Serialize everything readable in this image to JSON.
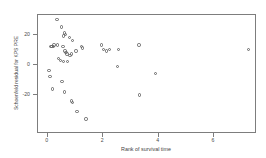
{
  "chart_data": {
    "type": "scatter",
    "title": "",
    "xlabel": "Rank of survival time",
    "ylabel": "Schoenfeld residual for KPS PRE",
    "xlim": [
      -0.35,
      7.55
    ],
    "ylim": [
      -46,
      33
    ],
    "xticks": [
      0,
      2,
      4,
      6
    ],
    "xticklabels": [
      "0",
      "2",
      "4",
      "6"
    ],
    "yticks": [
      20,
      0,
      -20
    ],
    "yticklabels": [
      "20",
      "0",
      "-20"
    ],
    "grid": false,
    "legend": null,
    "marker": "open-circle",
    "marker_color": "#666666",
    "series": [
      {
        "name": "Schoenfeld residuals",
        "x": [
          0.33,
          0.5,
          0.61,
          0.64,
          0.57,
          0.78,
          0.9,
          0.12,
          0.16,
          0.2,
          0.22,
          0.35,
          0.55,
          0.62,
          0.66,
          0.7,
          0.86,
          0.4,
          0.47,
          0.58,
          0.72,
          0.8,
          1.02,
          1.22,
          1.26,
          1.95,
          2.02,
          2.12,
          2.22,
          2.55,
          3.3,
          0.05,
          0.08,
          0.52,
          0.18,
          0.6,
          0.86,
          0.9,
          1.05,
          1.38,
          2.52,
          3.32,
          3.88,
          7.25
        ],
        "y": [
          30,
          25,
          21,
          20,
          19,
          18,
          16,
          12,
          12,
          12,
          13,
          13,
          12,
          9,
          8,
          7,
          7,
          4,
          3,
          2,
          2,
          6,
          9,
          12,
          11,
          13,
          10,
          9,
          10,
          10,
          13,
          -4,
          -8,
          -11,
          -16,
          -18,
          -24,
          -25,
          -31,
          -36,
          -1,
          -20,
          -6,
          10
        ]
      }
    ]
  }
}
